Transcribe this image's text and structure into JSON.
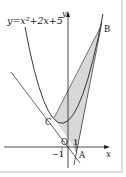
{
  "figure": {
    "equation_label": "y=x²+2x+5",
    "axis_labels": {
      "x": "x",
      "y": "y"
    },
    "origin_label": "O",
    "tick_labels": {
      "one": "1",
      "minus_one": "−1"
    },
    "points": {
      "A": "A",
      "B": "B",
      "C": "C"
    },
    "colors": {
      "stroke": "#222222",
      "shade": "#d8d8d8",
      "frame": "#bbbbbb"
    }
  }
}
